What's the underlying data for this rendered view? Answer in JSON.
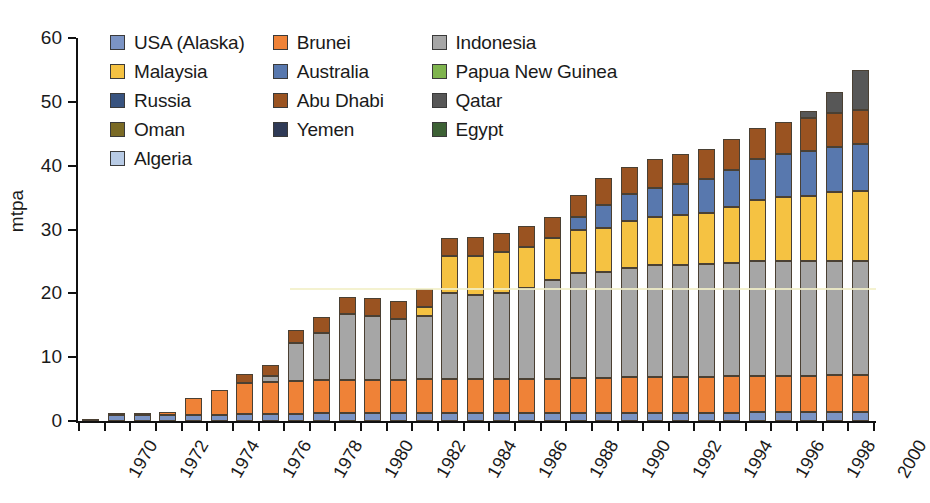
{
  "chart_data": {
    "type": "bar",
    "stacked": true,
    "title": "",
    "subtitle": "",
    "xlabel": "",
    "ylabel": "mtpa",
    "ylim": [
      0,
      60
    ],
    "yticks": [
      0,
      10,
      20,
      30,
      40,
      50,
      60
    ],
    "grid": false,
    "legend_position": "top-left",
    "x": [
      1969,
      1970,
      1971,
      1972,
      1973,
      1974,
      1975,
      1976,
      1977,
      1978,
      1979,
      1980,
      1981,
      1982,
      1983,
      1984,
      1985,
      1986,
      1987,
      1988,
      1989,
      1990,
      1991,
      1992,
      1993,
      1994,
      1995,
      1996,
      1997,
      1998,
      1999,
      2000
    ],
    "xtick_labels": [
      "1970",
      "1972",
      "1974",
      "1976",
      "1978",
      "1980",
      "1982",
      "1984",
      "1986",
      "1988",
      "1990",
      "1992",
      "1994",
      "1996",
      "1998",
      "2000"
    ],
    "xtick_years": [
      1970,
      1972,
      1974,
      1976,
      1978,
      1980,
      1982,
      1984,
      1986,
      1988,
      1990,
      1992,
      1994,
      1996,
      1998,
      2000
    ],
    "categories": [
      "1970",
      "1971",
      "1972",
      "1973",
      "1974",
      "1975",
      "1976",
      "1977",
      "1978",
      "1979",
      "1980",
      "1981",
      "1982",
      "1983",
      "1984",
      "1985",
      "1986",
      "1987",
      "1988",
      "1989",
      "1990",
      "1991",
      "1992",
      "1993",
      "1994",
      "1995",
      "1996",
      "1997",
      "1998",
      "1999",
      "2000"
    ],
    "series": [
      {
        "name": "USA (Alaska)",
        "color": "#7b94c4",
        "values": [
          0.2,
          0.9,
          0.9,
          1.0,
          1.0,
          1.0,
          1.1,
          1.1,
          1.1,
          1.2,
          1.2,
          1.2,
          1.2,
          1.2,
          1.2,
          1.2,
          1.2,
          1.2,
          1.2,
          1.2,
          1.2,
          1.3,
          1.3,
          1.3,
          1.3,
          1.3,
          1.4,
          1.4,
          1.4,
          1.4,
          1.4
        ]
      },
      {
        "name": "Brunei",
        "color": "#ef8237",
        "values": [
          0.0,
          0.1,
          0.1,
          0.4,
          2.6,
          3.8,
          4.9,
          5.0,
          5.1,
          5.2,
          5.3,
          5.3,
          5.3,
          5.4,
          5.4,
          5.4,
          5.4,
          5.4,
          5.4,
          5.5,
          5.5,
          5.6,
          5.6,
          5.6,
          5.6,
          5.7,
          5.7,
          5.7,
          5.7,
          5.8,
          5.8
        ]
      },
      {
        "name": "Indonesia",
        "color": "#a6a6a6",
        "values": [
          0.0,
          0.0,
          0.0,
          0.0,
          0.0,
          0.0,
          0.0,
          1.0,
          6.0,
          7.4,
          10.2,
          9.9,
          9.5,
          9.8,
          13.4,
          13.2,
          13.5,
          14.2,
          15.5,
          16.5,
          16.6,
          17.1,
          17.5,
          17.6,
          17.7,
          17.8,
          17.9,
          18.0,
          17.9,
          17.9,
          17.8
        ]
      },
      {
        "name": "Malaysia",
        "color": "#f5c242",
        "values": [
          0.0,
          0.0,
          0.0,
          0.0,
          0.0,
          0.0,
          0.0,
          0.0,
          0.0,
          0.0,
          0.0,
          0.0,
          0.0,
          1.5,
          5.8,
          6.1,
          6.4,
          6.5,
          6.6,
          6.7,
          7.0,
          7.3,
          7.5,
          7.8,
          8.0,
          8.7,
          9.7,
          10.0,
          10.3,
          10.7,
          11.1
        ]
      },
      {
        "name": "Australia",
        "color": "#5878ae",
        "values": [
          0.0,
          0.0,
          0.0,
          0.0,
          0.0,
          0.0,
          0.0,
          0.0,
          0.0,
          0.0,
          0.0,
          0.0,
          0.0,
          0.0,
          0.0,
          0.0,
          0.0,
          0.0,
          0.0,
          2.1,
          3.5,
          4.2,
          4.6,
          4.9,
          5.3,
          5.9,
          6.3,
          6.8,
          7.0,
          7.2,
          7.3
        ]
      },
      {
        "name": "Papua New Guinea",
        "color": "#7fb44e",
        "values": [
          0.0,
          0.0,
          0.0,
          0.0,
          0.0,
          0.0,
          0.0,
          0.0,
          0.0,
          0.0,
          0.0,
          0.0,
          0.0,
          0.0,
          0.0,
          0.0,
          0.0,
          0.0,
          0.0,
          0.0,
          0.0,
          0.0,
          0.0,
          0.0,
          0.0,
          0.0,
          0.0,
          0.0,
          0.0,
          0.0,
          0.0
        ]
      },
      {
        "name": "Russia",
        "color": "#38537f",
        "values": [
          0.0,
          0.0,
          0.0,
          0.0,
          0.0,
          0.0,
          0.0,
          0.0,
          0.0,
          0.0,
          0.0,
          0.0,
          0.0,
          0.0,
          0.0,
          0.0,
          0.0,
          0.0,
          0.0,
          0.0,
          0.0,
          0.0,
          0.0,
          0.0,
          0.0,
          0.0,
          0.0,
          0.0,
          0.0,
          0.0,
          0.0
        ]
      },
      {
        "name": "Abu Dhabi",
        "color": "#9a5321",
        "values": [
          0.0,
          0.0,
          0.0,
          0.0,
          0.0,
          0.0,
          1.3,
          1.6,
          2.0,
          2.5,
          2.7,
          2.8,
          2.8,
          2.8,
          2.8,
          2.9,
          3.0,
          3.2,
          3.3,
          3.4,
          4.2,
          4.3,
          4.5,
          4.6,
          4.7,
          4.8,
          4.9,
          5.0,
          5.1,
          5.2,
          5.3
        ]
      },
      {
        "name": "Qatar",
        "color": "#575757",
        "values": [
          0.0,
          0.0,
          0.0,
          0.0,
          0.0,
          0.0,
          0.0,
          0.0,
          0.0,
          0.0,
          0.0,
          0.0,
          0.0,
          0.0,
          0.0,
          0.0,
          0.0,
          0.0,
          0.0,
          0.0,
          0.0,
          0.0,
          0.0,
          0.0,
          0.0,
          0.0,
          0.0,
          0.0,
          1.1,
          3.4,
          6.3
        ]
      },
      {
        "name": "Oman",
        "color": "#7a6a25",
        "values": [
          0.0,
          0.0,
          0.0,
          0.0,
          0.0,
          0.0,
          0.0,
          0.0,
          0.0,
          0.0,
          0.0,
          0.0,
          0.0,
          0.0,
          0.0,
          0.0,
          0.0,
          0.0,
          0.0,
          0.0,
          0.0,
          0.0,
          0.0,
          0.0,
          0.0,
          0.0,
          0.0,
          0.0,
          0.0,
          0.0,
          0.0
        ]
      },
      {
        "name": "Yemen",
        "color": "#2f3a56",
        "values": [
          0.0,
          0.0,
          0.0,
          0.0,
          0.0,
          0.0,
          0.0,
          0.0,
          0.0,
          0.0,
          0.0,
          0.0,
          0.0,
          0.0,
          0.0,
          0.0,
          0.0,
          0.0,
          0.0,
          0.0,
          0.0,
          0.0,
          0.0,
          0.0,
          0.0,
          0.0,
          0.0,
          0.0,
          0.0,
          0.0,
          0.0
        ]
      },
      {
        "name": "Egypt",
        "color": "#3d6135",
        "values": [
          0.0,
          0.0,
          0.0,
          0.0,
          0.0,
          0.0,
          0.0,
          0.0,
          0.0,
          0.0,
          0.0,
          0.0,
          0.0,
          0.0,
          0.0,
          0.0,
          0.0,
          0.0,
          0.0,
          0.0,
          0.0,
          0.0,
          0.0,
          0.0,
          0.0,
          0.0,
          0.0,
          0.0,
          0.0,
          0.0,
          0.0
        ]
      },
      {
        "name": "Algeria",
        "color": "#b8cbe5",
        "values": [
          0.0,
          0.0,
          0.0,
          0.0,
          0.0,
          0.0,
          0.0,
          0.0,
          0.0,
          0.0,
          0.0,
          0.0,
          0.0,
          0.0,
          0.0,
          0.0,
          0.0,
          0.0,
          0.0,
          0.0,
          0.0,
          0.0,
          0.0,
          0.0,
          0.0,
          0.0,
          0.0,
          0.0,
          0.0,
          0.0,
          0.0
        ]
      }
    ],
    "totals": [
      0.2,
      1.0,
      1.0,
      1.4,
      3.6,
      4.8,
      6.0,
      8.1,
      11.5,
      14.0,
      16.6,
      16.4,
      16.5,
      18.2,
      26.9,
      27.5,
      28.3,
      29.3,
      30.7,
      33.0,
      36.2,
      38.1,
      39.0,
      40.4,
      41.2,
      42.7,
      44.4,
      46.9,
      48.0,
      49.4,
      54.0
    ]
  },
  "legend": {
    "rows": [
      [
        {
          "label": "USA (Alaska)",
          "color": "#7b94c4",
          "key": "usa-alaska"
        },
        {
          "label": "Brunei",
          "color": "#ef8237",
          "key": "brunei"
        },
        {
          "label": "Indonesia",
          "color": "#a6a6a6",
          "key": "indonesia"
        }
      ],
      [
        {
          "label": "Malaysia",
          "color": "#f5c242",
          "key": "malaysia"
        },
        {
          "label": "Australia",
          "color": "#5878ae",
          "key": "australia"
        },
        {
          "label": "Papua New Guinea",
          "color": "#7fb44e",
          "key": "papua-new-guinea"
        }
      ],
      [
        {
          "label": "Russia",
          "color": "#38537f",
          "key": "russia"
        },
        {
          "label": "Abu Dhabi",
          "color": "#9a5321",
          "key": "abu-dhabi"
        },
        {
          "label": "Qatar",
          "color": "#575757",
          "key": "qatar"
        }
      ],
      [
        {
          "label": "Oman",
          "color": "#7a6a25",
          "key": "oman"
        },
        {
          "label": "Yemen",
          "color": "#2f3a56",
          "key": "yemen"
        },
        {
          "label": "Egypt",
          "color": "#3d6135",
          "key": "egypt"
        }
      ],
      [
        {
          "label": "Algeria",
          "color": "#b8cbe5",
          "key": "algeria"
        }
      ]
    ]
  },
  "axes": {
    "y_title": "mtpa",
    "y_tick_labels": [
      "0",
      "10",
      "20",
      "30",
      "40",
      "50",
      "60"
    ]
  }
}
